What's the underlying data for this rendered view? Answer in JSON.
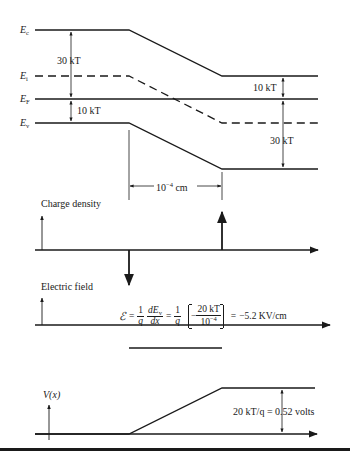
{
  "band_diagram": {
    "labels": {
      "ec": "E",
      "ec_sub": "c",
      "ei": "E",
      "ei_sub": "i",
      "ef": "E",
      "ef_sub": "F",
      "ev": "E",
      "ev_sub": "v"
    },
    "left_gap_ec_ef": "30 kT",
    "left_gap_ef_ev": "10 kT",
    "right_gap_ec_ef": "10 kT",
    "right_gap_ef_ev": "30 kT",
    "width_label_base": "10",
    "width_label_exp": "−4",
    "width_label_unit": "cm"
  },
  "charge_density": {
    "label": "Charge density"
  },
  "electric_field": {
    "label": "Electric field",
    "equation": {
      "symbol": "ℰ",
      "eq1": "=",
      "frac1_num": "1",
      "frac1_den": "q",
      "frac2_num": "dE",
      "frac2_num_sub": "v",
      "frac2_den": "dx",
      "eq2": "=",
      "frac3_num": "1",
      "frac3_den": "q",
      "minus": "−",
      "frac4_num": "20 kT",
      "frac4_den_base": "10",
      "frac4_den_exp": "−4",
      "eq3": "=",
      "result": "−5.2 KV/cm"
    }
  },
  "potential": {
    "label": "V(x)",
    "annotation": "20 kT/q = 0.52 volts"
  }
}
